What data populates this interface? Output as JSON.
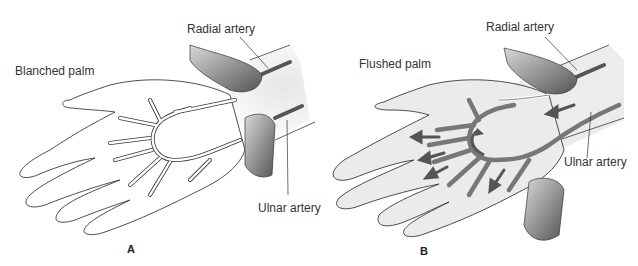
{
  "figure": {
    "panels": [
      {
        "id": "A",
        "letter": "A",
        "title": "Blanched palm",
        "labels": {
          "radial": "Radial artery",
          "ulnar": "Ulnar artery"
        },
        "state": "both arteries compressed"
      },
      {
        "id": "B",
        "letter": "B",
        "title": "Flushed palm",
        "labels": {
          "radial": "Radial artery",
          "ulnar": "Ulnar artery"
        },
        "state": "ulnar artery released, blood flow arrows"
      }
    ],
    "colors": {
      "skin_outline": "#3a3a3a",
      "skin_fill": "#ffffff",
      "skin_flushed": "#e9e9e9",
      "artery_filled": "#777777",
      "fingers_shadow": "#6b6b6b",
      "forearm_bg": "#eeeeee"
    }
  }
}
